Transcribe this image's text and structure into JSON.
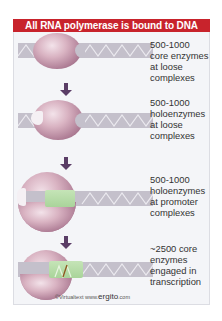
{
  "title": "All RNA polymerase is bound to DNA",
  "stages": [
    {
      "label": "500-1000\ncore enzymes\nat loose\ncomplexes",
      "description": "core enzyme loosely bound to DNA"
    },
    {
      "label": "500-1000\nholoenzymes\nat loose\ncomplexes",
      "description": "holoenzyme (with sigma) loosely bound to DNA"
    },
    {
      "label": "500-1000\nholoenzymes\nat promoter\ncomplexes",
      "description": "holoenzyme bound at promoter, DNA unwound"
    },
    {
      "label": "~2500 core\nenzymes\nengaged in\ntranscription",
      "description": "core enzyme transcribing with RNA"
    }
  ],
  "credit": {
    "prefix": "©Virtualtext  www.",
    "brand": "ergito",
    "suffix": ".com"
  },
  "colors": {
    "banner": "#c8232c",
    "dna": "#c4c0cb",
    "enzyme": "#b07f97",
    "open_dna": "#a9d49a",
    "arrow": "#5a3d66"
  }
}
